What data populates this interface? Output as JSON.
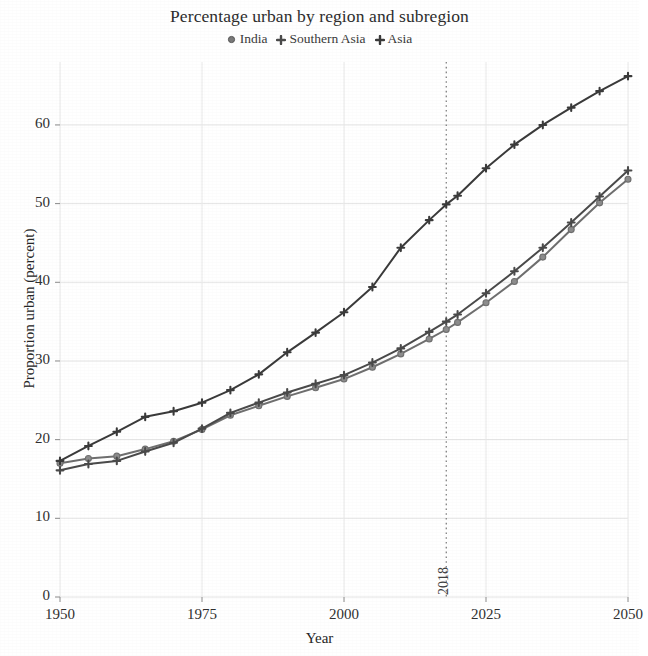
{
  "chart_data": {
    "type": "line",
    "title": "Percentage urban by region and subregion",
    "xlabel": "Year",
    "ylabel": "Proportion urban (percent)",
    "xlim": [
      1950,
      2050
    ],
    "ylim": [
      0,
      68
    ],
    "xticks": [
      "1950",
      "1975",
      "2000",
      "2025",
      "2050"
    ],
    "xtick_values": [
      1950,
      1975,
      2000,
      2025,
      2050
    ],
    "yticks": [
      "0",
      "10",
      "20",
      "30",
      "40",
      "50",
      "60"
    ],
    "ytick_values": [
      0,
      10,
      20,
      30,
      40,
      50,
      60
    ],
    "grid": true,
    "legend_position": "top-center",
    "annotation": {
      "label": "2018",
      "x_value": 2018,
      "style": "dotted-vertical-line"
    },
    "x": [
      1950,
      1955,
      1960,
      1965,
      1970,
      1975,
      1980,
      1985,
      1990,
      1995,
      2000,
      2005,
      2010,
      2015,
      2018,
      2020,
      2025,
      2030,
      2035,
      2040,
      2045,
      2050
    ],
    "series": [
      {
        "name": "India",
        "marker": "circle",
        "color": "#6f6f6f",
        "values": [
          17.0,
          17.6,
          17.9,
          18.8,
          19.8,
          21.3,
          23.1,
          24.3,
          25.5,
          26.6,
          27.7,
          29.2,
          30.9,
          32.8,
          34.0,
          34.9,
          37.4,
          40.1,
          43.2,
          46.7,
          50.1,
          53.1
        ]
      },
      {
        "name": "Southern Asia",
        "marker": "plus",
        "color": "#4a4a4a",
        "values": [
          16.1,
          16.9,
          17.3,
          18.5,
          19.6,
          21.4,
          23.4,
          24.7,
          26.0,
          27.1,
          28.2,
          29.8,
          31.6,
          33.7,
          35.0,
          35.9,
          38.6,
          41.4,
          44.4,
          47.6,
          50.9,
          54.2
        ]
      },
      {
        "name": "Asia",
        "marker": "plus",
        "color": "#3a3a3a",
        "values": [
          17.3,
          19.2,
          21.0,
          22.9,
          23.6,
          24.7,
          26.3,
          28.3,
          31.1,
          33.6,
          36.2,
          39.4,
          44.4,
          47.9,
          49.9,
          51.0,
          54.5,
          57.5,
          60.0,
          62.2,
          64.3,
          66.2
        ]
      }
    ]
  }
}
